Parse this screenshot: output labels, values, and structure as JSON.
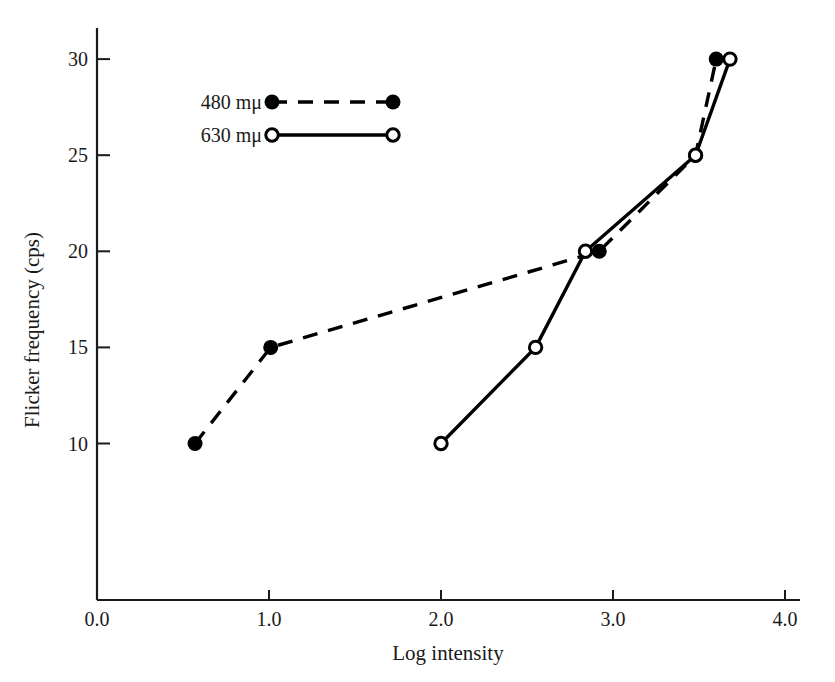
{
  "chart_data": {
    "type": "line",
    "title": "",
    "xlabel": "Log intensity",
    "ylabel": "Flicker frequency (cps)",
    "xlim": [
      0.0,
      4.1
    ],
    "ylim": [
      7.5,
      31.5
    ],
    "xticks": [
      "0.0",
      "1.0",
      "2.0",
      "3.0",
      "4.0"
    ],
    "xtick_values": [
      0.0,
      1.0,
      2.0,
      3.0,
      4.0
    ],
    "yticks": [
      "10",
      "15",
      "20",
      "25",
      "30"
    ],
    "ytick_values": [
      10,
      15,
      20,
      25,
      30
    ],
    "grid": false,
    "legend_position": "upper-left-inside",
    "series": [
      {
        "name": "480 mμ",
        "marker": "filled-circle",
        "linestyle": "dashed",
        "color": "#000000",
        "x": [
          0.57,
          1.01,
          2.92,
          3.48,
          3.6
        ],
        "y": [
          10,
          15,
          20,
          25,
          30
        ],
        "points": [
          {
            "x": 0.57,
            "y": 10
          },
          {
            "x": 1.01,
            "y": 15
          },
          {
            "x": 2.92,
            "y": 20
          },
          {
            "x": 3.48,
            "y": 25
          },
          {
            "x": 3.6,
            "y": 30
          }
        ]
      },
      {
        "name": "630 mμ",
        "marker": "open-circle",
        "linestyle": "solid",
        "color": "#000000",
        "x": [
          2.0,
          2.55,
          2.84,
          3.48,
          3.68
        ],
        "y": [
          10,
          15,
          20,
          25,
          30
        ],
        "points": [
          {
            "x": 2.0,
            "y": 10
          },
          {
            "x": 2.55,
            "y": 15
          },
          {
            "x": 2.84,
            "y": 20
          },
          {
            "x": 3.48,
            "y": 25
          },
          {
            "x": 3.68,
            "y": 30
          }
        ]
      }
    ]
  },
  "legend": {
    "entries": [
      {
        "label": "480 mμ",
        "marker": "filled-circle",
        "linestyle": "dashed"
      },
      {
        "label": "630 mμ",
        "marker": "open-circle",
        "linestyle": "solid"
      }
    ]
  },
  "axes": {
    "x": {
      "label": "Log intensity",
      "ticks": [
        {
          "label": "0.0",
          "value": 0.0
        },
        {
          "label": "1.0",
          "value": 1.0
        },
        {
          "label": "2.0",
          "value": 2.0
        },
        {
          "label": "3.0",
          "value": 3.0
        },
        {
          "label": "4.0",
          "value": 4.0
        }
      ]
    },
    "y": {
      "label": "Flicker frequency (cps)",
      "ticks": [
        {
          "label": "10",
          "value": 10
        },
        {
          "label": "15",
          "value": 15
        },
        {
          "label": "20",
          "value": 20
        },
        {
          "label": "25",
          "value": 25
        },
        {
          "label": "30",
          "value": 30
        }
      ]
    }
  },
  "colors": {
    "background": "#ffffff",
    "ink": "#1a1a1a",
    "line": "#000000"
  }
}
